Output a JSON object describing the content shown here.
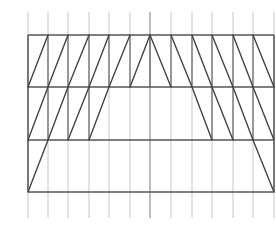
{
  "diagram": {
    "type": "truss-grid",
    "colors": {
      "background": "#ffffff",
      "grid": "#c8c8c8",
      "members": "#444444",
      "chords": "#555555"
    },
    "grid": {
      "x": [
        28,
        48,
        68,
        89,
        109,
        130,
        150,
        171,
        192,
        212,
        233,
        253,
        274
      ],
      "y_top": 12,
      "y_bottom": 218,
      "center_x": 150
    },
    "chords_y": [
      35,
      87,
      140,
      192
    ],
    "frame": {
      "left": 28,
      "right": 274,
      "top": 35,
      "bottom": 192
    },
    "posts": [
      {
        "x": 48,
        "y1": 35,
        "y2": 140
      },
      {
        "x": 68,
        "y1": 35,
        "y2": 140
      },
      {
        "x": 89,
        "y1": 35,
        "y2": 140
      },
      {
        "x": 109,
        "y1": 35,
        "y2": 87
      },
      {
        "x": 130,
        "y1": 35,
        "y2": 87
      },
      {
        "x": 150,
        "y1": 35,
        "y2": 87
      },
      {
        "x": 171,
        "y1": 35,
        "y2": 87
      },
      {
        "x": 192,
        "y1": 35,
        "y2": 87
      },
      {
        "x": 212,
        "y1": 35,
        "y2": 140
      },
      {
        "x": 233,
        "y1": 35,
        "y2": 140
      },
      {
        "x": 253,
        "y1": 35,
        "y2": 140
      }
    ],
    "diagonals": [
      {
        "x1": 28,
        "y1": 87,
        "x2": 48,
        "y2": 35
      },
      {
        "x1": 48,
        "y1": 87,
        "x2": 68,
        "y2": 35
      },
      {
        "x1": 68,
        "y1": 87,
        "x2": 89,
        "y2": 35
      },
      {
        "x1": 89,
        "y1": 87,
        "x2": 109,
        "y2": 35
      },
      {
        "x1": 109,
        "y1": 87,
        "x2": 130,
        "y2": 35
      },
      {
        "x1": 130,
        "y1": 87,
        "x2": 150,
        "y2": 35
      },
      {
        "x1": 150,
        "y1": 35,
        "x2": 171,
        "y2": 87
      },
      {
        "x1": 171,
        "y1": 35,
        "x2": 192,
        "y2": 87
      },
      {
        "x1": 192,
        "y1": 35,
        "x2": 212,
        "y2": 87
      },
      {
        "x1": 212,
        "y1": 35,
        "x2": 233,
        "y2": 87
      },
      {
        "x1": 233,
        "y1": 35,
        "x2": 253,
        "y2": 87
      },
      {
        "x1": 253,
        "y1": 35,
        "x2": 274,
        "y2": 87
      },
      {
        "x1": 28,
        "y1": 140,
        "x2": 48,
        "y2": 87
      },
      {
        "x1": 48,
        "y1": 140,
        "x2": 68,
        "y2": 87
      },
      {
        "x1": 68,
        "y1": 140,
        "x2": 89,
        "y2": 87
      },
      {
        "x1": 89,
        "y1": 140,
        "x2": 109,
        "y2": 87
      },
      {
        "x1": 192,
        "y1": 87,
        "x2": 212,
        "y2": 140
      },
      {
        "x1": 212,
        "y1": 87,
        "x2": 233,
        "y2": 140
      },
      {
        "x1": 233,
        "y1": 87,
        "x2": 253,
        "y2": 140
      },
      {
        "x1": 253,
        "y1": 87,
        "x2": 274,
        "y2": 140
      },
      {
        "x1": 28,
        "y1": 192,
        "x2": 48,
        "y2": 140
      },
      {
        "x1": 253,
        "y1": 140,
        "x2": 274,
        "y2": 192
      }
    ]
  }
}
